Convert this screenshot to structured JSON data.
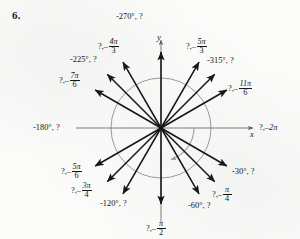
{
  "problem": {
    "number": "6."
  },
  "figure": {
    "type": "unit-circle-angle-diagram",
    "axis_labels": {
      "x": "x",
      "y": "y"
    },
    "origin": {
      "x": 161,
      "y": 128
    },
    "circle_radius": 50,
    "rotation_arc": {
      "direction": "clockwise",
      "from_deg": 0,
      "to_deg": -100
    },
    "colors": {
      "ink": "#161616",
      "circle": "#8a8a8a",
      "axis": "#707070",
      "arc": "#9a9a9a",
      "paper": "#fbfbfa"
    },
    "rays": [
      {
        "angle_deg": -30,
        "label_kind": "degrees",
        "degrees": "-30°",
        "unknown": "?",
        "text": "-30°, ?"
      },
      {
        "angle_deg": -45,
        "label_kind": "radians",
        "unknown": "?",
        "sign": "-",
        "num": "π",
        "den": "4"
      },
      {
        "angle_deg": -60,
        "label_kind": "degrees",
        "degrees": "-60°",
        "unknown": "?",
        "text": "-60°, ?"
      },
      {
        "angle_deg": -90,
        "label_kind": "radians",
        "unknown": "?",
        "sign": "-",
        "num": "π",
        "den": "2"
      },
      {
        "angle_deg": -120,
        "label_kind": "degrees",
        "degrees": "-120°",
        "unknown": "?",
        "text": "-120°, ?"
      },
      {
        "angle_deg": -135,
        "label_kind": "radians",
        "unknown": "?",
        "sign": "-",
        "num": "3π",
        "den": "4"
      },
      {
        "angle_deg": -150,
        "label_kind": "radians",
        "unknown": "?",
        "sign": "-",
        "num": "5π",
        "den": "6"
      },
      {
        "angle_deg": -180,
        "label_kind": "degrees",
        "degrees": "-180°",
        "unknown": "?",
        "text": "-180°, ?"
      },
      {
        "angle_deg": -210,
        "label_kind": "radians",
        "unknown": "?",
        "sign": "-",
        "num": "7π",
        "den": "6"
      },
      {
        "angle_deg": -225,
        "label_kind": "degrees",
        "degrees": "-225°",
        "unknown": "?",
        "text": "-225°, ?"
      },
      {
        "angle_deg": -240,
        "label_kind": "radians",
        "unknown": "?",
        "sign": "-",
        "num": "4π",
        "den": "3"
      },
      {
        "angle_deg": -270,
        "label_kind": "degrees",
        "degrees": "-270°",
        "unknown": "?",
        "text": "-270°, ?"
      },
      {
        "angle_deg": -300,
        "label_kind": "radians",
        "unknown": "?",
        "sign": "-",
        "num": "5π",
        "den": "3"
      },
      {
        "angle_deg": -315,
        "label_kind": "degrees",
        "degrees": "-315°",
        "unknown": "?",
        "text": "-315°, ?"
      },
      {
        "angle_deg": -330,
        "label_kind": "radians",
        "unknown": "?",
        "sign": "-",
        "num": "11π",
        "den": "6"
      },
      {
        "angle_deg": -360,
        "label_kind": "radians",
        "unknown": "?",
        "sign": "-",
        "num": "2π",
        "den": ""
      }
    ]
  },
  "labels": {
    "neg270": "-270°, ?",
    "neg315": "-315°, ?",
    "neg225": "-225°, ?",
    "neg180": "-180°, ?",
    "neg120": "-120°, ?",
    "neg60": "-60°, ?",
    "neg30": "-30°, ?",
    "q": "?,",
    "dash": "–",
    "pi": "π",
    "two_pi": "2π",
    "frac_4_3": {
      "num": "4π",
      "den": "3"
    },
    "frac_5_3": {
      "num": "5π",
      "den": "3"
    },
    "frac_7_6": {
      "num": "7π",
      "den": "6"
    },
    "frac_11_6": {
      "num": "11π",
      "den": "6"
    },
    "frac_5_6": {
      "num": "5π",
      "den": "6"
    },
    "frac_3_4": {
      "num": "3π",
      "den": "4"
    },
    "frac_pi_4": {
      "num": "π",
      "den": "4"
    },
    "frac_pi_2": {
      "num": "π",
      "den": "2"
    }
  }
}
